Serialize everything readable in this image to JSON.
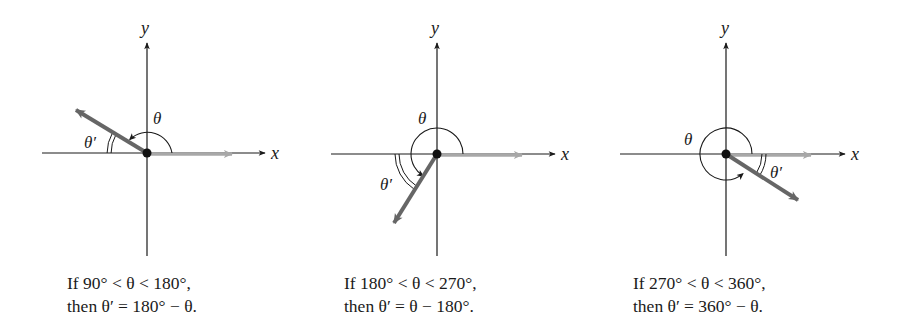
{
  "figure": {
    "colors": {
      "axis": "#1a1a1a",
      "initial_side": "#a8a8a8",
      "terminal_side": "#666666",
      "vertex": "#111111"
    },
    "axis_labels": {
      "x": "x",
      "y": "y"
    },
    "panels": [
      {
        "id": "quadrant-2",
        "theta_label": "θ",
        "theta_prime_label": "θ′",
        "terminal_angle_deg": 150,
        "caption": {
          "line1": "If 90° < θ < 180°,",
          "line2": "then θ′ = 180° − θ."
        }
      },
      {
        "id": "quadrant-3",
        "theta_label": "θ",
        "theta_prime_label": "θ′",
        "terminal_angle_deg": 237,
        "caption": {
          "line1": "If 180° < θ < 270°,",
          "line2": "then θ′ = θ − 180°."
        }
      },
      {
        "id": "quadrant-4",
        "theta_label": "θ",
        "theta_prime_label": "θ′",
        "terminal_angle_deg": 327,
        "caption": {
          "line1": "If 270° < θ < 360°,",
          "line2": "then θ′ = 360° − θ."
        }
      }
    ]
  }
}
